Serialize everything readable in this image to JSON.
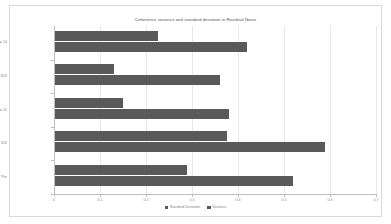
{
  "chart_data": {
    "type": "bar",
    "orientation": "horizontal",
    "title": "Coherence variance and standard deviation in Residual Noise",
    "xlabel": "",
    "ylabel": "",
    "xlim": [
      0,
      0.7
    ],
    "xticks": [
      "0",
      "0.1",
      "0.2",
      "0.3",
      "0.4",
      "0.5",
      "0.6",
      "0.7"
    ],
    "xtick_values": [
      0,
      0.1,
      0.2,
      0.3,
      0.4,
      0.5,
      0.6,
      0.7
    ],
    "grid": true,
    "legend_position": "bottom",
    "categories": [
      "Apple iPhone 14",
      "Samsung Galaxy S23",
      "Asus Zenfone 10",
      "Nexus 10X",
      "Pixel 7 Pro"
    ],
    "series": [
      {
        "name": "Standard Deviation",
        "color": "#595959",
        "values": [
          0.225,
          0.13,
          0.15,
          0.375,
          0.29
        ]
      },
      {
        "name": "Variance",
        "color": "#595959",
        "values": [
          0.42,
          0.36,
          0.38,
          0.59,
          0.52
        ]
      }
    ]
  },
  "legend": {
    "items": [
      {
        "label": "Standard Deviation"
      },
      {
        "label": "Variance"
      }
    ]
  }
}
